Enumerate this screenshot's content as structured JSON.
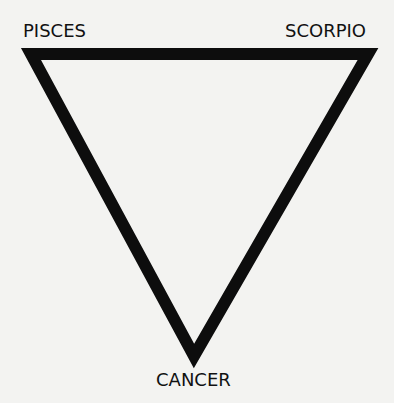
{
  "diagram": {
    "shape": "inverted-triangle",
    "stroke_color": "#0d0d0d",
    "background_color": "#f3f3f1",
    "stroke_width": 12,
    "vertices": {
      "top_left": {
        "label": "PISCES"
      },
      "top_right": {
        "label": "SCORPIO"
      },
      "bottom": {
        "label": "CANCER"
      }
    }
  }
}
